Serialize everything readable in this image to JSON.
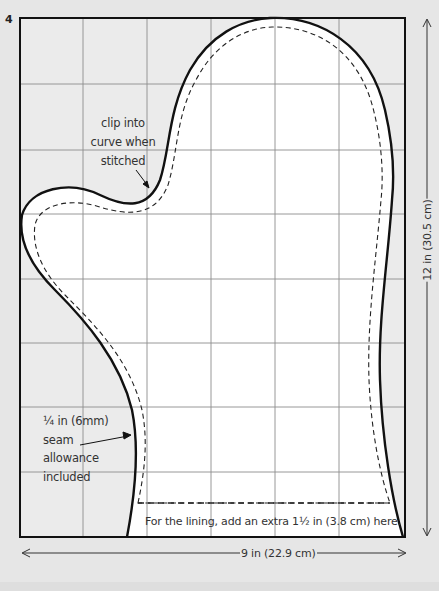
{
  "figure": {
    "step_number": "4",
    "annotations": {
      "clip_note": [
        "clip into",
        "curve when",
        "stitched"
      ],
      "seam_note": [
        "¼ in (6mm)",
        "seam",
        "allowance",
        "included"
      ],
      "lining_note": "For the lining, add an extra 1½ in (3.8 cm) here."
    },
    "dimensions": {
      "width": "9 in (22.9 cm)",
      "height": "12 in (30.5 cm)"
    },
    "grid": {
      "columns": 6,
      "rows": 8
    },
    "colors": {
      "background": "#e6e6e6",
      "panel": "#ebebeb",
      "mitten_fill": "#ffffff",
      "outline": "#111111",
      "grid_line": "#8a8a8a"
    }
  }
}
